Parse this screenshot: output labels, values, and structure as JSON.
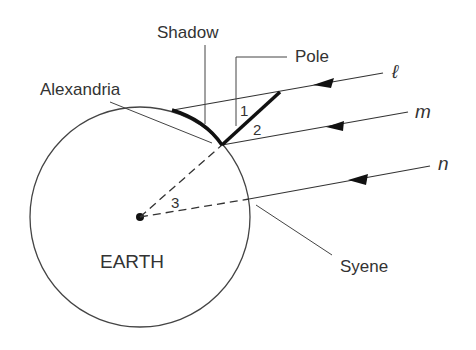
{
  "diagram": {
    "labels": {
      "shadow": "Shadow",
      "pole": "Pole",
      "alexandria": "Alexandria",
      "earth": "EARTH",
      "syene": "Syene"
    },
    "rays": [
      "ℓ",
      "m",
      "n"
    ],
    "angles": [
      "1",
      "2",
      "3"
    ],
    "colors": {
      "line": "#333333",
      "bold": "#111111"
    }
  }
}
